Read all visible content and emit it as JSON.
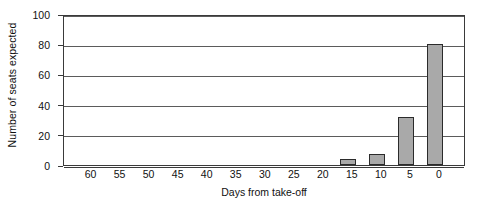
{
  "chart_data": {
    "type": "bar",
    "title": "",
    "subtitle": "",
    "xlabel": "Days from take-off",
    "ylabel": "Number of seats expected",
    "categories": [
      "60",
      "55",
      "50",
      "45",
      "40",
      "35",
      "30",
      "25",
      "20",
      "15",
      "10",
      "5",
      "0"
    ],
    "values": [
      0,
      0,
      0,
      0,
      0,
      0,
      0,
      0,
      0,
      4,
      7,
      32,
      80
    ],
    "series": [
      {
        "name": "Seats expected",
        "values": [
          0,
          0,
          0,
          0,
          0,
          0,
          0,
          0,
          0,
          4,
          7,
          32,
          80
        ]
      }
    ],
    "ylim": [
      0,
      100
    ],
    "yticks": [
      0,
      20,
      40,
      60,
      80,
      100
    ],
    "ytick_labels": [
      "0",
      "20",
      "40",
      "60",
      "80",
      "100"
    ],
    "xtick_labels": [
      "60",
      "55",
      "50",
      "45",
      "40",
      "35",
      "30",
      "25",
      "20",
      "15",
      "10",
      "5",
      "0"
    ],
    "grid": true,
    "grid_axis": "y",
    "legend": false,
    "legend_position": "none",
    "bar_fill_color": "#a9a9a9",
    "bar_edge_color": "#2b2b2b",
    "axis_color": "#3a3a3a",
    "gridline_color": "#5b5b5b",
    "background_color": "#ffffff",
    "annotations": []
  }
}
